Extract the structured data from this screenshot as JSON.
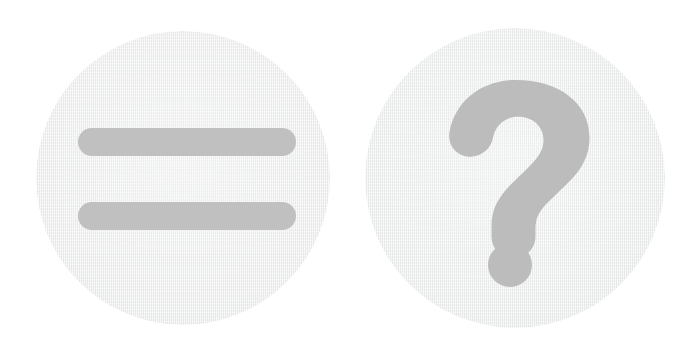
{
  "canvas": {
    "width": 694,
    "height": 358,
    "background_color": "#ffffff"
  },
  "badges": [
    {
      "id": "equals",
      "icon_name": "equals-icon",
      "label": "Equals",
      "symbol": "=",
      "disc_color": "#eff0f0",
      "glyph_color": "#c0c0c0",
      "center_x": 183,
      "center_y": 178,
      "radius": 147,
      "bars": [
        {
          "name": "equals-bar-top",
          "x": 78,
          "y": 128,
          "width": 218,
          "height": 28
        },
        {
          "name": "equals-bar-bottom",
          "x": 78,
          "y": 202,
          "width": 218,
          "height": 28
        }
      ]
    },
    {
      "id": "question",
      "icon_name": "question-mark-icon",
      "label": "Question mark",
      "symbol": "?",
      "disc_color": "#eff0f0",
      "glyph_color": "#bcbcbc",
      "center_x": 515,
      "center_y": 178,
      "radius": 150,
      "dot": {
        "name": "question-mark-dot",
        "center_x": 510,
        "center_y": 265,
        "radius": 22
      }
    }
  ]
}
